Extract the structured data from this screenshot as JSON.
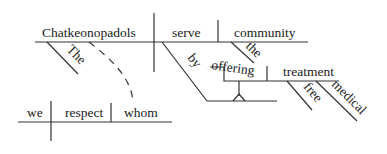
{
  "diagram": {
    "type": "reed-kellogg-sentence-diagram",
    "sentence": "The Chatkeonopadols, whom we respect, serve the community by offering free medical treatment.",
    "main_clause": {
      "subject": "Chatkeonopadols",
      "verb": "serve",
      "direct_object": "community",
      "subject_modifier": "The",
      "object_modifier": "the",
      "preposition": "by",
      "gerund": "offering",
      "gerund_object": "treatment",
      "gerund_object_modifiers": [
        "free",
        "medical"
      ]
    },
    "relative_clause": {
      "subject": "we",
      "verb": "respect",
      "direct_object": "whom"
    }
  }
}
